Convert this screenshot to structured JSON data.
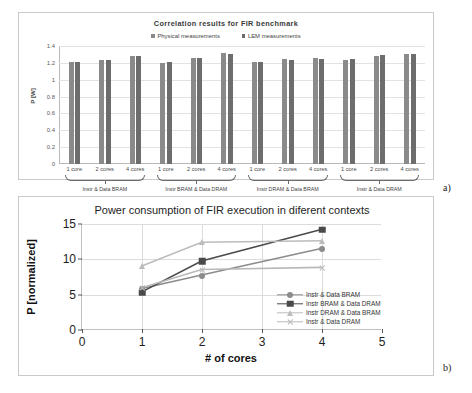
{
  "figure": {
    "caption_a": "a)",
    "caption_b": "b)"
  },
  "chart_data": [
    {
      "panel": "a",
      "type": "bar",
      "title": "Correlation results for FIR benchmark",
      "xlabel": "",
      "ylabel": "P [W]",
      "ylim": [
        0,
        1.4
      ],
      "yticks": [
        "0",
        "0.2",
        "0.4",
        "0.6",
        "0.8",
        "1",
        "1.2",
        "1.4"
      ],
      "ytick_values": [
        0,
        0.2,
        0.4,
        0.6,
        0.8,
        1,
        1.2,
        1.4
      ],
      "grid": true,
      "legend_position": "top-center",
      "categories": [
        "1 core",
        "2 cores",
        "4 cores",
        "1 core",
        "2 cores",
        "4 cores",
        "1 core",
        "2 cores",
        "4 cores",
        "1 core",
        "2 cores",
        "4 cores"
      ],
      "group_labels": [
        "Instr & Data BRAM",
        "Instr BRAM & Data DRAM",
        "Instr DRAM & Data BRAM",
        "Instr & Data DRAM"
      ],
      "series": [
        {
          "name": "Physical measurements",
          "color": "#8a8a8a",
          "values": [
            1.21,
            1.235,
            1.28,
            1.195,
            1.255,
            1.315,
            1.205,
            1.245,
            1.255,
            1.23,
            1.285,
            1.3
          ]
        },
        {
          "name": "LEM measurements",
          "color": "#6d6d6d",
          "values": [
            1.21,
            1.235,
            1.28,
            1.205,
            1.255,
            1.31,
            1.215,
            1.24,
            1.245,
            1.25,
            1.29,
            1.3
          ]
        }
      ]
    },
    {
      "panel": "b",
      "type": "line",
      "title": "Power consumption of FIR execution in diferent contexts",
      "xlabel": "# of cores",
      "ylabel": "P [normalized]",
      "xlim": [
        0,
        5
      ],
      "ylim": [
        0,
        15
      ],
      "xticks": [
        "0",
        "1",
        "2",
        "3",
        "4",
        "5"
      ],
      "xtick_values": [
        0,
        1,
        2,
        3,
        4,
        5
      ],
      "yticks": [
        "0",
        "5",
        "10",
        "15"
      ],
      "ytick_values": [
        0,
        5,
        10,
        15
      ],
      "grid": true,
      "legend_position": "inside-right",
      "x": [
        1,
        2,
        4
      ],
      "series": [
        {
          "name": "Instr & Data BRAM",
          "marker": "circle",
          "color": "#8c8c8c",
          "values": [
            5.8,
            7.7,
            11.5
          ]
        },
        {
          "name": "Instr BRAM & Data DRAM",
          "marker": "square",
          "color": "#4a4a4a",
          "values": [
            5.3,
            9.7,
            14.2
          ]
        },
        {
          "name": "Instr DRAM & Data BRAM",
          "marker": "triangle",
          "color": "#bcbcbc",
          "values": [
            9.0,
            12.4,
            12.6
          ]
        },
        {
          "name": "Instr & Data DRAM",
          "marker": "x",
          "color": "#b9b9b9",
          "values": [
            5.9,
            8.5,
            8.8
          ]
        }
      ]
    }
  ]
}
